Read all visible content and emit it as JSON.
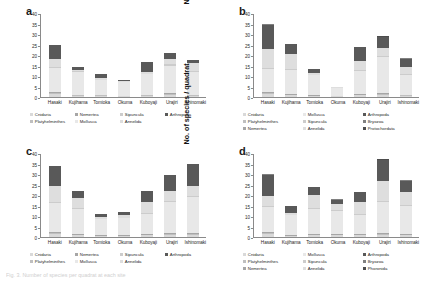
{
  "figure": {
    "caption_fragment": "Fig. 3.  Number of species per quadrat at each site"
  },
  "axis": {
    "ylabel": "No. of species / quadrat",
    "yticks": [
      "0",
      "5",
      "10",
      "15",
      "20",
      "25",
      "30",
      "35",
      "40"
    ],
    "ymin": 0,
    "ymax": 40
  },
  "palette": {
    "cnidaria": "#d9d9d9",
    "platyhelminthes": "#bfbfbf",
    "nemertea": "#a6a6a6",
    "mollusca": "#e8e8e8",
    "sipuncula": "#cccccc",
    "annelida": "#dedede",
    "arthropoda": "#595959",
    "bryozoa": "#808080",
    "protochordata": "#4d4d4d",
    "phoronida": "#4d4d4d",
    "axis": "#8a8a8a"
  },
  "panels": [
    {
      "id": "a",
      "letter": "a",
      "legend_columns": 4,
      "chart_data": {
        "type": "bar",
        "stacked": true,
        "title": "a",
        "xlabel": "",
        "ylabel": "No. of species / quadrat",
        "ylim": [
          0,
          40
        ],
        "grid": false,
        "legend_position": "below",
        "categories": [
          "Hasaki",
          "Kujihama",
          "Tomioka",
          "Okuma",
          "Kuboyaji",
          "Urajiri",
          "Ishinomaki"
        ],
        "series": [
          {
            "name": "Cnidaria",
            "color": "#d9d9d9",
            "values": [
              1.5,
              0.5,
              0.5,
              0.3,
              0.5,
              1.0,
              0.5
            ]
          },
          {
            "name": "Platyhelminthes",
            "color": "#bfbfbf",
            "values": [
              0.5,
              0.3,
              0.3,
              0.2,
              0.3,
              0.5,
              0.3
            ]
          },
          {
            "name": "Nemertea",
            "color": "#a6a6a6",
            "values": [
              0.5,
              0.2,
              0.2,
              0.2,
              0.2,
              0.5,
              0.2
            ]
          },
          {
            "name": "Mollusca",
            "color": "#e8e8e8",
            "values": [
              11.5,
              11.0,
              7.0,
              6.3,
              10.0,
              13.0,
              11.0
            ]
          },
          {
            "name": "Sipuncula",
            "color": "#cccccc",
            "values": [
              0.5,
              0.2,
              0.2,
              0.2,
              0.2,
              0.5,
              0.2
            ]
          },
          {
            "name": "Annelida",
            "color": "#dedede",
            "values": [
              3.5,
              0.8,
              0.8,
              0.3,
              0.8,
              2.5,
              3.8
            ]
          },
          {
            "name": "Arthropoda",
            "color": "#595959",
            "values": [
              7.0,
              1.5,
              2.0,
              0.5,
              4.5,
              3.0,
              1.5
            ]
          }
        ],
        "totals": [
          25.0,
          14.5,
          11.0,
          8.0,
          16.5,
          21.0,
          17.5
        ]
      }
    },
    {
      "id": "b",
      "letter": "b",
      "legend_columns": 3,
      "chart_data": {
        "type": "bar",
        "stacked": true,
        "title": "b",
        "xlabel": "",
        "ylabel": "No. of species / quadrat",
        "ylim": [
          0,
          40
        ],
        "grid": false,
        "legend_position": "below",
        "categories": [
          "Hasaki",
          "Kujihama",
          "Tomioka",
          "Okuma",
          "Kuboyaji",
          "Urajiri",
          "Ishinomaki"
        ],
        "series": [
          {
            "name": "Cnidaria",
            "color": "#d9d9d9",
            "values": [
              1.5,
              0.8,
              0.5,
              0.3,
              0.8,
              1.0,
              0.5
            ]
          },
          {
            "name": "Platyhelminthes",
            "color": "#bfbfbf",
            "values": [
              0.5,
              0.3,
              0.2,
              0.2,
              0.3,
              0.5,
              0.3
            ]
          },
          {
            "name": "Nemertea",
            "color": "#a6a6a6",
            "values": [
              0.5,
              0.3,
              0.2,
              0.2,
              0.3,
              0.5,
              0.2
            ]
          },
          {
            "name": "Mollusca",
            "color": "#e8e8e8",
            "values": [
              11.0,
              11.5,
              9.5,
              3.5,
              11.0,
              17.0,
              9.5
            ]
          },
          {
            "name": "Sipuncula",
            "color": "#cccccc",
            "values": [
              0.5,
              0.3,
              0.2,
              0.2,
              0.3,
              0.5,
              0.3
            ]
          },
          {
            "name": "Annelida",
            "color": "#dedede",
            "values": [
              9.0,
              7.5,
              0.8,
              0.3,
              4.5,
              4.0,
              3.5
            ]
          },
          {
            "name": "Arthropoda",
            "color": "#595959",
            "values": [
              11.5,
              4.5,
              2.0,
              0.3,
              6.5,
              5.0,
              4.0
            ]
          },
          {
            "name": "Bryozoa",
            "color": "#808080",
            "values": [
              0.3,
              0.3,
              0.1,
              0.0,
              0.2,
              0.3,
              0.2
            ]
          },
          {
            "name": "Protochordata",
            "color": "#4d4d4d",
            "values": [
              0.2,
              0.0,
              0.0,
              0.0,
              0.1,
              0.2,
              0.0
            ]
          }
        ],
        "totals": [
          35.0,
          25.5,
          13.5,
          5.0,
          24.0,
          29.0,
          18.5
        ]
      }
    },
    {
      "id": "c",
      "letter": "c",
      "legend_columns": 4,
      "chart_data": {
        "type": "bar",
        "stacked": true,
        "title": "c",
        "xlabel": "",
        "ylabel": "No. of species / quadrat",
        "ylim": [
          0,
          40
        ],
        "grid": false,
        "legend_position": "below",
        "categories": [
          "Hasaki",
          "Kujihama",
          "Tomioka",
          "Okuma",
          "Kuboyaji",
          "Urajiri",
          "Ishinomaki"
        ],
        "series": [
          {
            "name": "Cnidaria",
            "color": "#d9d9d9",
            "values": [
              1.2,
              0.8,
              0.5,
              0.5,
              0.8,
              1.0,
              1.0
            ]
          },
          {
            "name": "Platyhelminthes",
            "color": "#bfbfbf",
            "values": [
              0.5,
              0.3,
              0.2,
              0.2,
              0.3,
              0.5,
              0.5
            ]
          },
          {
            "name": "Nemertea",
            "color": "#a6a6a6",
            "values": [
              0.5,
              0.3,
              0.2,
              0.2,
              0.3,
              0.5,
              0.3
            ]
          },
          {
            "name": "Mollusca",
            "color": "#e8e8e8",
            "values": [
              13.8,
              12.1,
              7.6,
              8.1,
              9.6,
              14.5,
              17.2
            ]
          },
          {
            "name": "Sipuncula",
            "color": "#cccccc",
            "values": [
              0.5,
              0.3,
              0.2,
              0.2,
              0.3,
              0.5,
              0.5
            ]
          },
          {
            "name": "Annelida",
            "color": "#dedede",
            "values": [
              8.0,
              4.7,
              0.8,
              1.3,
              5.2,
              5.0,
              5.0
            ]
          },
          {
            "name": "Arthropoda",
            "color": "#595959",
            "values": [
              9.5,
              3.5,
              1.5,
              1.5,
              5.5,
              7.5,
              10.5
            ]
          }
        ],
        "totals": [
          34.0,
          22.0,
          11.0,
          12.0,
          22.0,
          29.5,
          35.0
        ]
      }
    },
    {
      "id": "d",
      "letter": "d",
      "legend_columns": 3,
      "chart_data": {
        "type": "bar",
        "stacked": true,
        "title": "d",
        "xlabel": "",
        "ylabel": "No. of species / quadrat",
        "ylim": [
          0,
          40
        ],
        "grid": false,
        "legend_position": "below",
        "categories": [
          "Hasaki",
          "Kujihama",
          "Tomioka",
          "Okuma",
          "Kuboyaji",
          "Urajiri",
          "Ishinomaki"
        ],
        "series": [
          {
            "name": "Cnidaria",
            "color": "#d9d9d9",
            "values": [
              1.2,
              0.5,
              0.8,
              0.8,
              0.8,
              1.0,
              0.8
            ]
          },
          {
            "name": "Platyhelminthes",
            "color": "#bfbfbf",
            "values": [
              0.5,
              0.2,
              0.3,
              0.3,
              0.3,
              0.5,
              0.3
            ]
          },
          {
            "name": "Nemertea",
            "color": "#a6a6a6",
            "values": [
              0.5,
              0.2,
              0.3,
              0.2,
              0.3,
              0.5,
              0.3
            ]
          },
          {
            "name": "Mollusca",
            "color": "#e8e8e8",
            "values": [
              12.3,
              9.6,
              12.1,
              11.2,
              9.1,
              14.5,
              13.6
            ]
          },
          {
            "name": "Sipuncula",
            "color": "#cccccc",
            "values": [
              0.5,
              0.2,
              0.3,
              0.3,
              0.3,
              0.5,
              0.3
            ]
          },
          {
            "name": "Annelida",
            "color": "#dedede",
            "values": [
              4.5,
              0.8,
              6.0,
              3.0,
              6.0,
              9.5,
              6.0
            ]
          },
          {
            "name": "Arthropoda",
            "color": "#595959",
            "values": [
              10.0,
              3.3,
              3.8,
              2.0,
              4.5,
              10.0,
              5.5
            ]
          },
          {
            "name": "Bryozoa",
            "color": "#808080",
            "values": [
              0.3,
              0.1,
              0.2,
              0.1,
              0.2,
              0.3,
              0.2
            ]
          },
          {
            "name": "Phoronida",
            "color": "#4d4d4d",
            "values": [
              0.2,
              0.1,
              0.2,
              0.1,
              0.0,
              0.2,
              0.0
            ]
          }
        ],
        "totals": [
          30.0,
          15.0,
          24.0,
          18.0,
          21.5,
          37.0,
          27.0
        ]
      }
    }
  ]
}
